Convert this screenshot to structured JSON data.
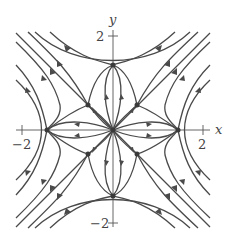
{
  "figure": {
    "type": "phase-portrait",
    "axes": {
      "x_label": "x",
      "y_label": "y",
      "x_ticks": [
        {
          "value": -2,
          "label": "−2"
        },
        {
          "value": 2,
          "label": "2"
        }
      ],
      "y_ticks": [
        {
          "value": 2,
          "label": "2"
        },
        {
          "value": -2,
          "label": "−2"
        }
      ]
    },
    "equilibria": [
      {
        "x": 0,
        "y": 0,
        "kind": "unstable-node-center"
      },
      {
        "x": -2,
        "y": 0,
        "kind": "saddle"
      },
      {
        "x": 2,
        "y": 0,
        "kind": "saddle"
      },
      {
        "x": 0,
        "y": 2,
        "kind": "saddle"
      },
      {
        "x": 0,
        "y": -2,
        "kind": "saddle"
      },
      {
        "x": -1,
        "y": 1,
        "kind": "stable-node"
      },
      {
        "x": 1,
        "y": 1,
        "kind": "stable-node"
      },
      {
        "x": -1,
        "y": -1,
        "kind": "stable-node"
      },
      {
        "x": 1,
        "y": -1,
        "kind": "stable-node"
      }
    ],
    "colors": {
      "stroke": "#4a4a4a",
      "axis": "#555555",
      "background": "#ffffff"
    }
  }
}
